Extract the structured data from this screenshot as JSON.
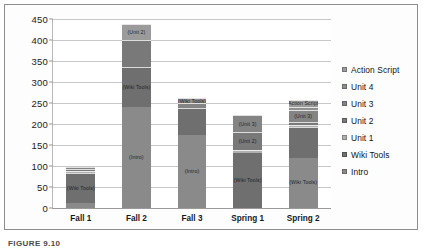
{
  "caption": "FIGURE 9.10",
  "chart_data": {
    "type": "bar",
    "subtype": "stacked-bar",
    "title": "",
    "xlabel": "",
    "ylabel": "",
    "ylim": [
      0,
      450
    ],
    "ytick_step": 50,
    "yticks": [
      "0",
      "50",
      "100",
      "150",
      "200",
      "250",
      "300",
      "350",
      "400",
      "450"
    ],
    "grid": true,
    "legend_position": "right",
    "categories": [
      "Fall 1",
      "Fall 2",
      "Fall 3",
      "Spring 1",
      "Spring 2"
    ],
    "legend": [
      {
        "name": "Action Script",
        "color": "#9b9b9b"
      },
      {
        "name": "Unit 4",
        "color": "#8f8f8f"
      },
      {
        "name": "Unit 3",
        "color": "#848484"
      },
      {
        "name": "Unit 2",
        "color": "#797979"
      },
      {
        "name": "Unit 1",
        "color": "#b0b0b0"
      },
      {
        "name": "Wiki Tools",
        "color": "#6f6f6f"
      },
      {
        "name": "Intro",
        "color": "#8a8a8a"
      }
    ],
    "series": [
      {
        "name": "Intro",
        "color": "#8a8a8a",
        "values": [
          12,
          240,
          175,
          0,
          120
        ]
      },
      {
        "name": "Wiki Tools",
        "color": "#6f6f6f",
        "values": [
          72,
          95,
          62,
          130,
          72
        ]
      },
      {
        "name": "Unit 1",
        "color": "#b0b0b0",
        "values": [
          4,
          0,
          0,
          8,
          6
        ]
      },
      {
        "name": "Unit 2",
        "color": "#797979",
        "values": [
          5,
          65,
          0,
          42,
          8
        ]
      },
      {
        "name": "Unit 3",
        "color": "#848484",
        "values": [
          4,
          0,
          12,
          42,
          28
        ]
      },
      {
        "name": "Unit 4",
        "color": "#8f8f8f",
        "values": [
          0,
          0,
          13,
          0,
          6
        ]
      },
      {
        "name": "Action Script",
        "color": "#9b9b9b",
        "values": [
          0,
          37,
          0,
          0,
          18
        ]
      }
    ],
    "totals": [
      97,
      437,
      262,
      222,
      258
    ],
    "segment_labels": [
      [
        {
          "series": "Wiki Tools",
          "text": "(Wiki Tools)"
        }
      ],
      [
        {
          "series": "Intro",
          "text": "(Intro)"
        },
        {
          "series": "Wiki Tools",
          "text": "(Wiki Tools)"
        },
        {
          "series": "Action Script",
          "text": "(Unit 2)"
        }
      ],
      [
        {
          "series": "Intro",
          "text": "(Intro)"
        },
        {
          "series": "Unit 4",
          "text": "(Wiki Tools)"
        }
      ],
      [
        {
          "series": "Wiki Tools",
          "text": "(Wiki Tools)"
        },
        {
          "series": "Unit 2",
          "text": "(Unit 2)"
        },
        {
          "series": "Unit 3",
          "text": "(Unit 3)"
        }
      ],
      [
        {
          "series": "Intro",
          "text": "(Wiki Tools)"
        },
        {
          "series": "Unit 3",
          "text": "(Unit 3)"
        },
        {
          "series": "Action Script",
          "text": "(Action Script)"
        }
      ]
    ]
  }
}
